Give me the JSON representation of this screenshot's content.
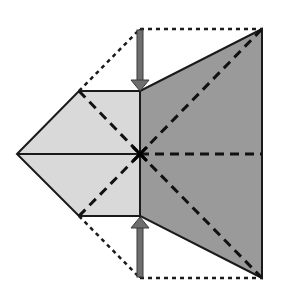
{
  "diagram": {
    "title": "Origami fold step diagram",
    "colors": {
      "background": "#ffffff",
      "light_fill": "#d9d9d9",
      "dark_fill": "#9a9a9a",
      "line": "#1a1a1a",
      "arrow": "#6e6e6e"
    },
    "points": {
      "center": [
        140,
        154
      ],
      "left_tip": [
        17,
        154
      ],
      "light_top_left": [
        79,
        91
      ],
      "light_bottom_left": [
        79,
        216
      ],
      "light_top_right": [
        140,
        91
      ],
      "light_bottom_right": [
        140,
        216
      ],
      "top_mid": [
        140,
        29
      ],
      "bottom_mid": [
        140,
        278
      ],
      "top_right": [
        262,
        29
      ],
      "bottom_right": [
        262,
        278
      ]
    },
    "elements": [
      {
        "id": "light-flap",
        "type": "polygon",
        "label": "Light gray pentagon flap"
      },
      {
        "id": "dark-flap",
        "type": "polygon",
        "label": "Dark gray trapezoid flap"
      },
      {
        "id": "valley-folds",
        "type": "dashed-lines",
        "label": "Dashed valley fold lines radiating from center"
      },
      {
        "id": "hidden-edges",
        "type": "dotted-lines",
        "label": "Dotted outline of unfolded paper"
      },
      {
        "id": "arrow-down",
        "type": "arrow",
        "label": "Fold arrow pointing down"
      },
      {
        "id": "arrow-up",
        "type": "arrow",
        "label": "Fold arrow pointing up"
      }
    ]
  }
}
